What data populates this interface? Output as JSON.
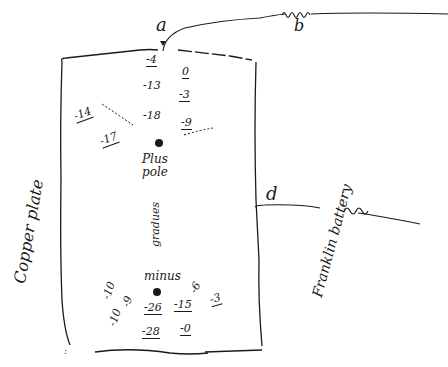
{
  "diagram": {
    "labels": {
      "terminal_a_top": "a",
      "coil_b": "b",
      "terminal_d_right": "d",
      "copper_plate": "Copper plate",
      "plus_pole": "Plus pole",
      "minus_pole": "minus",
      "gradient_word": "gradues",
      "battery": "Franklin battery"
    },
    "upper_readings": {
      "column_left": [
        "-4",
        "-13",
        "-18"
      ],
      "column_right": [
        "0",
        "-3",
        "-9"
      ],
      "left_side": [
        "-14",
        "-17"
      ]
    },
    "lower_readings": {
      "left_side": [
        "-10",
        "-10",
        "-9"
      ],
      "center": [
        "-26",
        "-28"
      ],
      "right": [
        "-15",
        "-0",
        "-6",
        "-3"
      ]
    },
    "colors": {
      "ink": "#1a1a1a",
      "paper": "#ffffff"
    }
  }
}
